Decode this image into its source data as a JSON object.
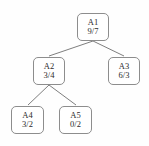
{
  "diagram": {
    "type": "tree",
    "background_color": "#fefefe",
    "node_border_color": "#8d8d8d",
    "node_fill_color": "#ffffff",
    "edge_color": "#6f6f6f",
    "nodes": [
      {
        "id": "a1",
        "label": "A1",
        "value": "9/7"
      },
      {
        "id": "a2",
        "label": "A2",
        "value": "3/4"
      },
      {
        "id": "a3",
        "label": "A3",
        "value": "6/3"
      },
      {
        "id": "a4",
        "label": "A4",
        "value": "3/2"
      },
      {
        "id": "a5",
        "label": "A5",
        "value": "0/2"
      }
    ],
    "edges": [
      {
        "from": "a1",
        "to": "a2"
      },
      {
        "from": "a1",
        "to": "a3"
      },
      {
        "from": "a2",
        "to": "a4"
      },
      {
        "from": "a2",
        "to": "a5"
      }
    ]
  }
}
